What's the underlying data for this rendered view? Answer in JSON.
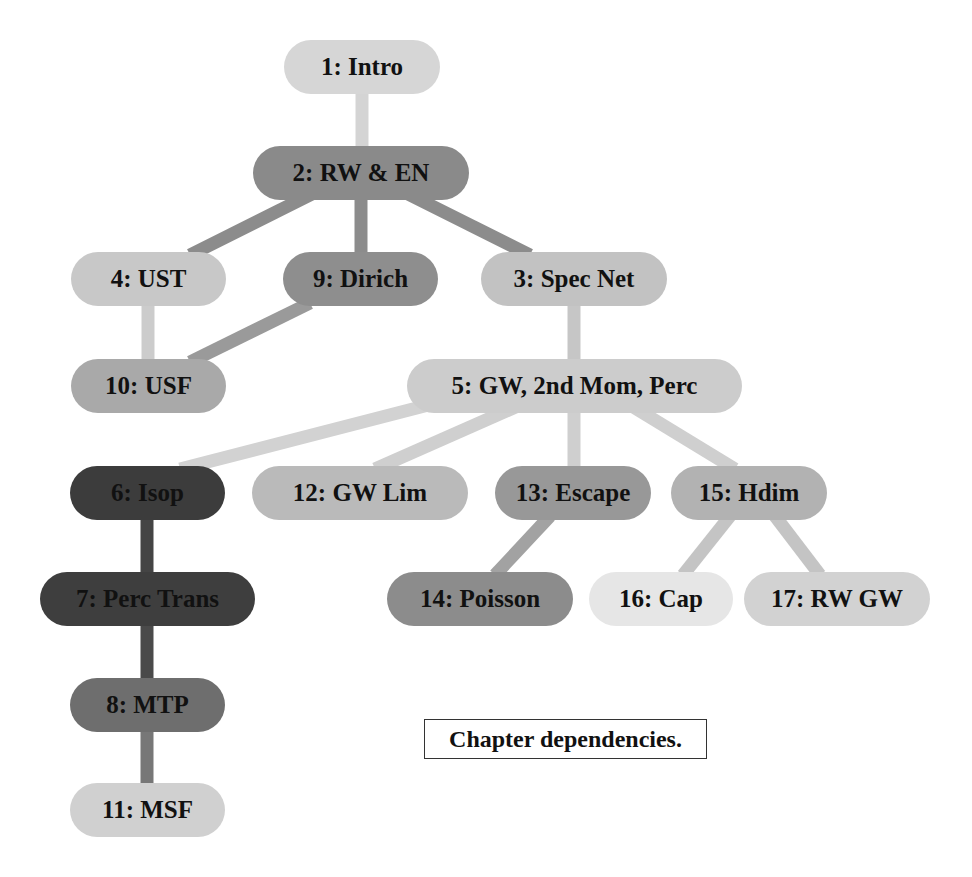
{
  "caption": "Chapter dependencies.",
  "nodes": [
    {
      "id": 1,
      "label": "1: Intro",
      "x": 284,
      "y": 40,
      "w": 156,
      "color": "#d6d6d6"
    },
    {
      "id": 2,
      "label": "2: RW & EN",
      "x": 253,
      "y": 146,
      "w": 216,
      "color": "#8a8a8a"
    },
    {
      "id": 4,
      "label": "4: UST",
      "x": 71,
      "y": 252,
      "w": 155,
      "color": "#c8c8c8"
    },
    {
      "id": 9,
      "label": "9: Dirich",
      "x": 283,
      "y": 252,
      "w": 155,
      "color": "#8e8e8e"
    },
    {
      "id": 3,
      "label": "3: Spec Net",
      "x": 481,
      "y": 252,
      "w": 186,
      "color": "#c2c2c2"
    },
    {
      "id": 10,
      "label": "10: USF",
      "x": 71,
      "y": 359,
      "w": 155,
      "color": "#a9a9a9"
    },
    {
      "id": 5,
      "label": "5: GW, 2nd Mom, Perc",
      "x": 407,
      "y": 359,
      "w": 335,
      "color": "#cccccc"
    },
    {
      "id": 6,
      "label": "6: Isop",
      "x": 70,
      "y": 466,
      "w": 155,
      "color": "#3c3c3c"
    },
    {
      "id": 12,
      "label": "12: GW Lim",
      "x": 252,
      "y": 466,
      "w": 216,
      "color": "#bababa"
    },
    {
      "id": 13,
      "label": "13: Escape",
      "x": 495,
      "y": 466,
      "w": 156,
      "color": "#989898"
    },
    {
      "id": 15,
      "label": "15: Hdim",
      "x": 671,
      "y": 466,
      "w": 156,
      "color": "#b2b2b2"
    },
    {
      "id": 7,
      "label": "7: Perc Trans",
      "x": 40,
      "y": 572,
      "w": 215,
      "color": "#3e3e3e"
    },
    {
      "id": 14,
      "label": "14: Poisson",
      "x": 387,
      "y": 572,
      "w": 186,
      "color": "#8c8c8c"
    },
    {
      "id": 16,
      "label": "16: Cap",
      "x": 589,
      "y": 572,
      "w": 144,
      "color": "#e6e6e6"
    },
    {
      "id": 17,
      "label": "17: RW GW",
      "x": 744,
      "y": 572,
      "w": 186,
      "color": "#d2d2d2"
    },
    {
      "id": 8,
      "label": "8: MTP",
      "x": 70,
      "y": 678,
      "w": 155,
      "color": "#6e6e6e"
    },
    {
      "id": 11,
      "label": "11: MSF",
      "x": 70,
      "y": 783,
      "w": 155,
      "color": "#d0d0d0"
    }
  ],
  "edges": [
    {
      "from": 1,
      "to": 2,
      "x1": 362,
      "y1": 94,
      "x2": 362,
      "y2": 146,
      "color": "#d4d4d4"
    },
    {
      "from": 2,
      "to": 4,
      "x1": 320,
      "y1": 190,
      "x2": 190,
      "y2": 255,
      "color": "#8c8c8c"
    },
    {
      "from": 2,
      "to": 9,
      "x1": 361,
      "y1": 198,
      "x2": 361,
      "y2": 254,
      "color": "#8c8c8c"
    },
    {
      "from": 2,
      "to": 3,
      "x1": 400,
      "y1": 190,
      "x2": 530,
      "y2": 255,
      "color": "#8c8c8c"
    },
    {
      "from": 4,
      "to": 10,
      "x1": 148,
      "y1": 304,
      "x2": 148,
      "y2": 361,
      "color": "#cccccc"
    },
    {
      "from": 9,
      "to": 10,
      "x1": 310,
      "y1": 303,
      "x2": 190,
      "y2": 362,
      "color": "#9a9a9a"
    },
    {
      "from": 3,
      "to": 5,
      "x1": 574,
      "y1": 304,
      "x2": 574,
      "y2": 361,
      "color": "#c6c6c6"
    },
    {
      "from": 5,
      "to": 6,
      "x1": 440,
      "y1": 402,
      "x2": 180,
      "y2": 469,
      "color": "#d2d2d2"
    },
    {
      "from": 5,
      "to": 12,
      "x1": 520,
      "y1": 405,
      "x2": 375,
      "y2": 469,
      "color": "#cfcfcf"
    },
    {
      "from": 5,
      "to": 13,
      "x1": 574,
      "y1": 411,
      "x2": 574,
      "y2": 468,
      "color": "#cfcfcf"
    },
    {
      "from": 5,
      "to": 15,
      "x1": 630,
      "y1": 405,
      "x2": 735,
      "y2": 469,
      "color": "#cfcfcf"
    },
    {
      "from": 6,
      "to": 7,
      "x1": 147,
      "y1": 518,
      "x2": 147,
      "y2": 574,
      "color": "#444444"
    },
    {
      "from": 7,
      "to": 8,
      "x1": 147,
      "y1": 624,
      "x2": 147,
      "y2": 680,
      "color": "#4a4a4a"
    },
    {
      "from": 8,
      "to": 11,
      "x1": 147,
      "y1": 729,
      "x2": 147,
      "y2": 785,
      "color": "#777777"
    },
    {
      "from": 13,
      "to": 14,
      "x1": 550,
      "y1": 516,
      "x2": 495,
      "y2": 575,
      "color": "#a2a2a2"
    },
    {
      "from": 15,
      "to": 16,
      "x1": 730,
      "y1": 516,
      "x2": 683,
      "y2": 575,
      "color": "#c4c4c4"
    },
    {
      "from": 15,
      "to": 17,
      "x1": 775,
      "y1": 516,
      "x2": 820,
      "y2": 575,
      "color": "#c4c4c4"
    }
  ]
}
